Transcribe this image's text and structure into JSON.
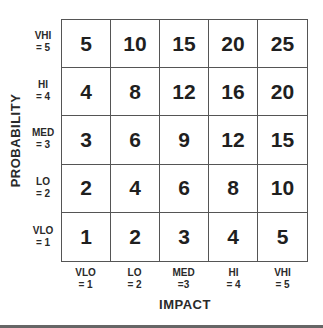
{
  "axes": {
    "y_title": "PROBABILITY",
    "x_title": "IMPACT",
    "y_labels": [
      {
        "name": "VHI",
        "value": "= 5"
      },
      {
        "name": "HI",
        "value": "= 4"
      },
      {
        "name": "MED",
        "value": "= 3"
      },
      {
        "name": "LO",
        "value": "= 2"
      },
      {
        "name": "VLO",
        "value": "= 1"
      }
    ],
    "x_labels": [
      {
        "name": "VLO",
        "value": "= 1"
      },
      {
        "name": "LO",
        "value": "= 2"
      },
      {
        "name": "MED",
        "value": "=3"
      },
      {
        "name": "HI",
        "value": "= 4"
      },
      {
        "name": "VHI",
        "value": "= 5"
      }
    ]
  },
  "matrix": {
    "rows": [
      [
        "5",
        "10",
        "15",
        "20",
        "25"
      ],
      [
        "4",
        "8",
        "12",
        "16",
        "20"
      ],
      [
        "3",
        "6",
        "9",
        "12",
        "15"
      ],
      [
        "2",
        "4",
        "6",
        "8",
        "10"
      ],
      [
        "1",
        "2",
        "3",
        "4",
        "5"
      ]
    ]
  }
}
